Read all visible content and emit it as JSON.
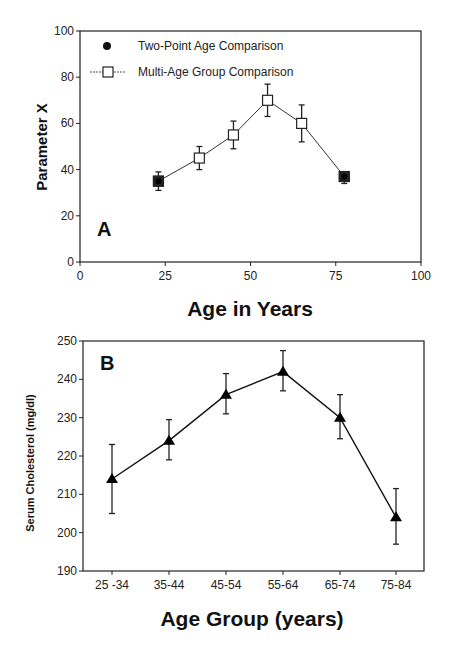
{
  "chart_data": [
    {
      "panel": "A",
      "type": "line",
      "title": "",
      "xlabel": "Age in Years",
      "ylabel": "Parameter X",
      "xlim": [
        0,
        100
      ],
      "ylim": [
        0,
        100
      ],
      "xticks": [
        0,
        25,
        50,
        75,
        100
      ],
      "yticks": [
        0,
        20,
        40,
        60,
        80,
        100
      ],
      "grid": false,
      "legend_position": "upper left",
      "series": [
        {
          "name": "Two-Point Age Comparison",
          "marker": "filled-circle",
          "x": [
            23,
            77.5
          ],
          "values": [
            35,
            37
          ],
          "err_low": [
            31,
            34
          ],
          "err_high": [
            39,
            39
          ]
        },
        {
          "name": "Multi-Age Group Comparison",
          "marker": "open-square",
          "x": [
            23,
            35,
            45,
            55,
            65,
            77.5
          ],
          "values": [
            35,
            45,
            55,
            70,
            60,
            37
          ],
          "err_low": [
            31,
            40,
            49,
            63,
            52,
            34
          ],
          "err_high": [
            39,
            50,
            61,
            77,
            68,
            39
          ]
        }
      ]
    },
    {
      "panel": "B",
      "type": "line",
      "title": "",
      "xlabel": "Age Group (years)",
      "ylabel": "Serum Cholesterol (mg/dl)",
      "ylim": [
        190,
        250
      ],
      "yticks": [
        190,
        200,
        210,
        220,
        230,
        240,
        250
      ],
      "grid": false,
      "categories": [
        "25 -34",
        "35-44",
        "45-54",
        "55-64",
        "65-74",
        "75-84"
      ],
      "series": [
        {
          "name": "Serum Cholesterol",
          "marker": "filled-triangle",
          "values": [
            214,
            224,
            236,
            242,
            230,
            204
          ],
          "err_low": [
            205,
            219,
            231,
            237,
            224.5,
            197
          ],
          "err_high": [
            223,
            229.5,
            241.5,
            247.5,
            236,
            211.5
          ]
        }
      ]
    }
  ]
}
